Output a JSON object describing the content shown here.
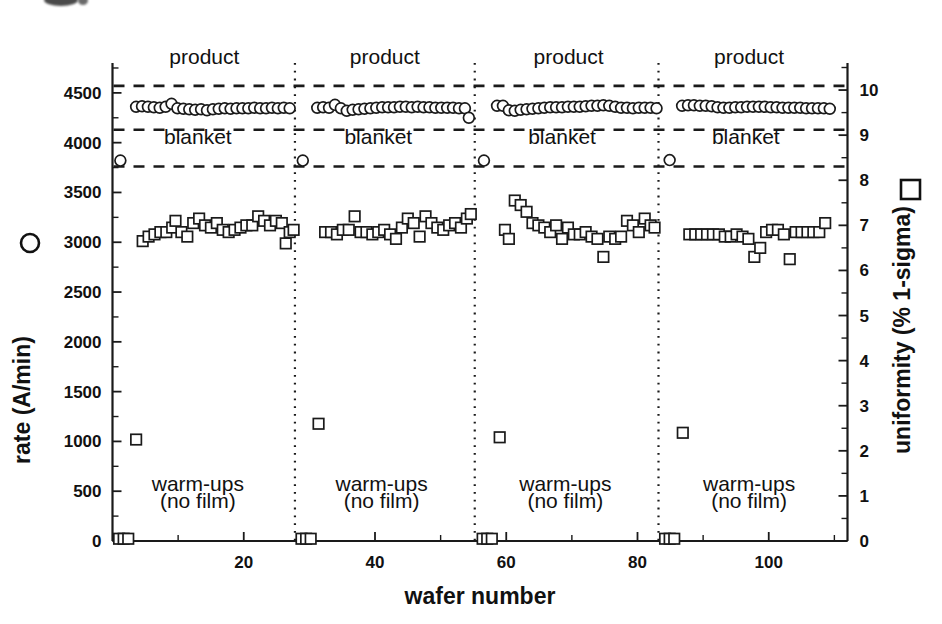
{
  "chart_data": {
    "type": "scatter",
    "title": "",
    "xlabel": "wafer number",
    "ylabel_left": "rate (A/min)  O",
    "ylabel_right": "uniformity (% 1-sigma)  □",
    "ylabel_left_text": "rate (A/min)",
    "ylabel_right_text": "uniformity (% 1-sigma)",
    "xlim": [
      0,
      112
    ],
    "ylim_left": [
      0,
      4800
    ],
    "ylim_right": [
      0,
      10.6
    ],
    "xticks": [
      20,
      40,
      60,
      80,
      100
    ],
    "xticklabels": [
      "20",
      "40",
      "60",
      "80",
      "100"
    ],
    "xtick_minor_step": 10,
    "yticks_left": [
      0,
      500,
      1000,
      1500,
      2000,
      2500,
      3000,
      3500,
      4000,
      4500
    ],
    "yticklabels_left": [
      "0",
      "500",
      "1000",
      "1500",
      "2000",
      "2500",
      "3000",
      "3500",
      "4000",
      "4500"
    ],
    "yticks_right": [
      0,
      1,
      2,
      3,
      4,
      5,
      6,
      7,
      8,
      9,
      10
    ],
    "yticklabels_right": [
      "0",
      "1",
      "2",
      "3",
      "4",
      "5",
      "6",
      "7",
      "8",
      "9",
      "10"
    ],
    "grid": false,
    "legend_position": "axis-labels",
    "legend": [
      {
        "name": "rate (A/min)",
        "marker": "circle",
        "axis": "left"
      },
      {
        "name": "uniformity (% 1-sigma)",
        "marker": "square",
        "axis": "right"
      }
    ],
    "reference_lines": [
      {
        "value_left": 4570,
        "style": "dashed",
        "label": "upper product spec"
      },
      {
        "value_left": 4130,
        "style": "dashed",
        "label": "lower product spec"
      },
      {
        "value_left": 3760,
        "style": "dashed",
        "label": "blanket spec"
      }
    ],
    "panel_separators_x": [
      27.8,
      55.2,
      83.2
    ],
    "panel_annotations": [
      {
        "text": "product",
        "x": 14,
        "y_left": 4790
      },
      {
        "text": "product",
        "x": 41.5,
        "y_left": 4790
      },
      {
        "text": "product",
        "x": 69.5,
        "y_left": 4790
      },
      {
        "text": "product",
        "x": 97,
        "y_left": 4790
      },
      {
        "text": "blanket",
        "x": 13,
        "y_left": 3990
      },
      {
        "text": "blanket",
        "x": 40.5,
        "y_left": 3990
      },
      {
        "text": "blanket",
        "x": 68.5,
        "y_left": 3990
      },
      {
        "text": "blanket",
        "x": 96.5,
        "y_left": 3990
      },
      {
        "text": "warm-ups",
        "x": 13,
        "y_left": 500
      },
      {
        "text": "(no film)",
        "x": 13,
        "y_left": 330
      },
      {
        "text": "warm-ups",
        "x": 41,
        "y_left": 500
      },
      {
        "text": "(no film)",
        "x": 41,
        "y_left": 330
      },
      {
        "text": "warm-ups",
        "x": 69,
        "y_left": 500
      },
      {
        "text": "(no film)",
        "x": 69,
        "y_left": 330
      },
      {
        "text": "warm-ups",
        "x": 97,
        "y_left": 500
      },
      {
        "text": "(no film)",
        "x": 97,
        "y_left": 330
      }
    ],
    "series": [
      {
        "name": "rate (A/min)",
        "marker": "circle",
        "axis": "left",
        "points": [
          [
            1.2,
            3820
          ],
          [
            3.6,
            4360
          ],
          [
            4.5,
            4365
          ],
          [
            5.4,
            4360
          ],
          [
            6.3,
            4355
          ],
          [
            7.2,
            4350
          ],
          [
            8.1,
            4360
          ],
          [
            9.0,
            4390
          ],
          [
            9.9,
            4345
          ],
          [
            10.8,
            4340
          ],
          [
            11.7,
            4335
          ],
          [
            12.6,
            4330
          ],
          [
            13.5,
            4335
          ],
          [
            14.4,
            4325
          ],
          [
            15.3,
            4335
          ],
          [
            16.2,
            4340
          ],
          [
            17.1,
            4345
          ],
          [
            18.0,
            4340
          ],
          [
            18.9,
            4345
          ],
          [
            19.8,
            4345
          ],
          [
            20.7,
            4345
          ],
          [
            21.6,
            4350
          ],
          [
            22.5,
            4345
          ],
          [
            23.4,
            4345
          ],
          [
            24.3,
            4350
          ],
          [
            25.2,
            4345
          ],
          [
            26.1,
            4350
          ],
          [
            27.0,
            4345
          ],
          [
            29.0,
            3820
          ],
          [
            31.2,
            4350
          ],
          [
            32.1,
            4355
          ],
          [
            33.0,
            4350
          ],
          [
            33.9,
            4380
          ],
          [
            34.8,
            4345
          ],
          [
            35.7,
            4320
          ],
          [
            36.6,
            4330
          ],
          [
            37.5,
            4335
          ],
          [
            38.4,
            4340
          ],
          [
            39.3,
            4345
          ],
          [
            40.2,
            4350
          ],
          [
            41.1,
            4355
          ],
          [
            42.0,
            4355
          ],
          [
            42.9,
            4355
          ],
          [
            43.8,
            4360
          ],
          [
            44.7,
            4360
          ],
          [
            45.6,
            4355
          ],
          [
            46.5,
            4360
          ],
          [
            47.4,
            4355
          ],
          [
            48.3,
            4355
          ],
          [
            49.2,
            4350
          ],
          [
            50.1,
            4350
          ],
          [
            51.0,
            4350
          ],
          [
            51.9,
            4350
          ],
          [
            52.8,
            4345
          ],
          [
            53.7,
            4345
          ],
          [
            54.3,
            4250
          ],
          [
            56.6,
            3820
          ],
          [
            58.6,
            4370
          ],
          [
            59.5,
            4370
          ],
          [
            60.4,
            4325
          ],
          [
            61.3,
            4320
          ],
          [
            62.2,
            4330
          ],
          [
            63.1,
            4335
          ],
          [
            64.0,
            4340
          ],
          [
            64.9,
            4345
          ],
          [
            65.8,
            4350
          ],
          [
            66.7,
            4355
          ],
          [
            67.6,
            4355
          ],
          [
            68.5,
            4355
          ],
          [
            69.4,
            4360
          ],
          [
            70.3,
            4360
          ],
          [
            71.2,
            4360
          ],
          [
            72.1,
            4365
          ],
          [
            73.0,
            4370
          ],
          [
            73.9,
            4370
          ],
          [
            74.8,
            4375
          ],
          [
            75.7,
            4370
          ],
          [
            76.6,
            4360
          ],
          [
            77.5,
            4350
          ],
          [
            78.4,
            4350
          ],
          [
            79.3,
            4345
          ],
          [
            80.2,
            4350
          ],
          [
            81.1,
            4350
          ],
          [
            82.0,
            4350
          ],
          [
            82.9,
            4345
          ],
          [
            84.9,
            3825
          ],
          [
            86.8,
            4370
          ],
          [
            87.7,
            4375
          ],
          [
            88.6,
            4375
          ],
          [
            89.5,
            4370
          ],
          [
            90.4,
            4370
          ],
          [
            91.3,
            4365
          ],
          [
            92.2,
            4355
          ],
          [
            93.1,
            4350
          ],
          [
            94.0,
            4350
          ],
          [
            94.9,
            4355
          ],
          [
            95.8,
            4355
          ],
          [
            96.7,
            4360
          ],
          [
            97.6,
            4360
          ],
          [
            98.5,
            4360
          ],
          [
            99.4,
            4360
          ],
          [
            100.3,
            4355
          ],
          [
            101.2,
            4355
          ],
          [
            102.1,
            4350
          ],
          [
            103.0,
            4350
          ],
          [
            103.9,
            4350
          ],
          [
            104.8,
            4350
          ],
          [
            105.7,
            4345
          ],
          [
            106.6,
            4345
          ],
          [
            107.5,
            4345
          ],
          [
            108.4,
            4345
          ],
          [
            109.3,
            4340
          ]
        ]
      },
      {
        "name": "uniformity (% 1-sigma)",
        "marker": "square",
        "axis": "right",
        "points_right_axis": [
          [
            1.0,
            0.05
          ],
          [
            1.7,
            0.05
          ],
          [
            2.4,
            0.05
          ],
          [
            3.6,
            2.25
          ],
          [
            4.6,
            6.65
          ],
          [
            5.5,
            6.75
          ],
          [
            6.4,
            6.8
          ],
          [
            7.3,
            6.85
          ],
          [
            8.2,
            6.85
          ],
          [
            9.1,
            6.95
          ],
          [
            9.6,
            7.1
          ],
          [
            10.5,
            6.85
          ],
          [
            11.4,
            6.75
          ],
          [
            12.3,
            7.05
          ],
          [
            13.2,
            7.15
          ],
          [
            14.1,
            7.0
          ],
          [
            15.0,
            6.95
          ],
          [
            15.9,
            7.05
          ],
          [
            16.8,
            6.9
          ],
          [
            17.7,
            6.85
          ],
          [
            18.6,
            6.9
          ],
          [
            19.5,
            6.95
          ],
          [
            20.4,
            7.0
          ],
          [
            21.3,
            7.0
          ],
          [
            22.2,
            7.2
          ],
          [
            23.1,
            7.1
          ],
          [
            24.0,
            7.0
          ],
          [
            24.9,
            7.1
          ],
          [
            25.8,
            7.05
          ],
          [
            26.4,
            6.6
          ],
          [
            27.0,
            6.85
          ],
          [
            27.6,
            6.9
          ],
          [
            28.8,
            0.05
          ],
          [
            29.5,
            0.05
          ],
          [
            30.2,
            0.05
          ],
          [
            31.4,
            2.6
          ],
          [
            32.4,
            6.85
          ],
          [
            33.3,
            6.85
          ],
          [
            34.2,
            6.8
          ],
          [
            35.1,
            6.9
          ],
          [
            36.0,
            6.9
          ],
          [
            36.9,
            7.2
          ],
          [
            37.8,
            6.85
          ],
          [
            38.7,
            6.85
          ],
          [
            39.6,
            6.8
          ],
          [
            40.5,
            6.85
          ],
          [
            41.4,
            6.9
          ],
          [
            42.3,
            6.8
          ],
          [
            43.2,
            6.7
          ],
          [
            44.1,
            6.95
          ],
          [
            45.0,
            7.15
          ],
          [
            45.9,
            7.05
          ],
          [
            46.8,
            6.75
          ],
          [
            47.7,
            7.2
          ],
          [
            48.6,
            7.05
          ],
          [
            49.5,
            6.95
          ],
          [
            50.4,
            6.9
          ],
          [
            51.3,
            7.0
          ],
          [
            52.2,
            7.05
          ],
          [
            53.1,
            6.95
          ],
          [
            54.0,
            7.15
          ],
          [
            54.6,
            7.25
          ],
          [
            56.4,
            0.05
          ],
          [
            57.1,
            0.05
          ],
          [
            57.8,
            0.05
          ],
          [
            59.0,
            2.3
          ],
          [
            59.8,
            6.9
          ],
          [
            60.4,
            6.7
          ],
          [
            61.3,
            7.55
          ],
          [
            62.2,
            7.45
          ],
          [
            63.1,
            7.3
          ],
          [
            64.0,
            7.05
          ],
          [
            64.9,
            7.0
          ],
          [
            65.8,
            6.95
          ],
          [
            66.7,
            6.85
          ],
          [
            67.6,
            7.0
          ],
          [
            68.5,
            6.7
          ],
          [
            69.4,
            6.95
          ],
          [
            70.3,
            6.8
          ],
          [
            71.2,
            6.8
          ],
          [
            72.1,
            6.85
          ],
          [
            73.0,
            6.75
          ],
          [
            73.9,
            6.7
          ],
          [
            74.8,
            6.3
          ],
          [
            75.7,
            6.75
          ],
          [
            76.6,
            6.7
          ],
          [
            77.5,
            6.75
          ],
          [
            78.4,
            7.1
          ],
          [
            79.3,
            7.0
          ],
          [
            80.2,
            6.85
          ],
          [
            81.1,
            7.15
          ],
          [
            82.0,
            7.0
          ],
          [
            82.6,
            6.95
          ],
          [
            84.2,
            0.05
          ],
          [
            84.9,
            0.05
          ],
          [
            85.6,
            0.05
          ],
          [
            86.9,
            2.4
          ],
          [
            87.9,
            6.8
          ],
          [
            88.8,
            6.8
          ],
          [
            89.7,
            6.8
          ],
          [
            90.6,
            6.8
          ],
          [
            91.5,
            6.8
          ],
          [
            92.4,
            6.8
          ],
          [
            93.3,
            6.75
          ],
          [
            94.2,
            6.75
          ],
          [
            95.1,
            6.8
          ],
          [
            96.0,
            6.75
          ],
          [
            96.9,
            6.7
          ],
          [
            97.8,
            6.3
          ],
          [
            98.7,
            6.5
          ],
          [
            99.6,
            6.85
          ],
          [
            100.5,
            6.9
          ],
          [
            101.4,
            6.9
          ],
          [
            102.3,
            6.8
          ],
          [
            103.2,
            6.25
          ],
          [
            104.1,
            6.85
          ],
          [
            105.0,
            6.85
          ],
          [
            105.9,
            6.85
          ],
          [
            106.8,
            6.85
          ],
          [
            107.7,
            6.85
          ],
          [
            108.6,
            7.05
          ]
        ]
      }
    ]
  },
  "annotations": {
    "product_label": "product",
    "blanket_label": "blanket",
    "warmups_label": "warm-ups",
    "nofilm_label": "(no film)"
  },
  "colors": {
    "ink": "#1a1a1a",
    "background": "#ffffff"
  }
}
